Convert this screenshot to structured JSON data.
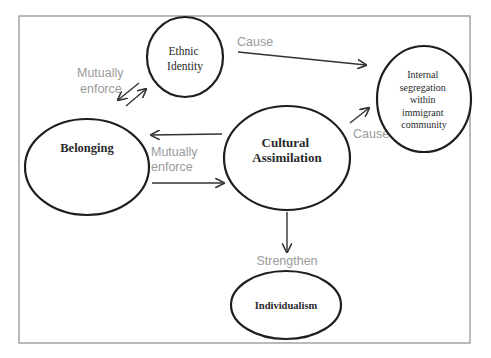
{
  "diagram": {
    "type": "concept-map",
    "nodes": {
      "ethnic_identity": {
        "lines": [
          "Ethnic",
          "Identity"
        ]
      },
      "internal_segregation": {
        "lines": [
          "Internal",
          "segregation",
          "within",
          "immigrant",
          "community"
        ]
      },
      "belonging": {
        "lines": [
          "Belonging"
        ]
      },
      "cultural_assimilation": {
        "lines": [
          "Cultural",
          "Assimilation"
        ]
      },
      "individualism": {
        "lines": [
          "Individualism"
        ]
      }
    },
    "edges": {
      "ethnic_to_segregation": {
        "from": "Ethnic Identity",
        "to": "Internal segregation within immigrant community",
        "label": "Cause"
      },
      "assimilation_to_segregation": {
        "from": "Cultural Assimilation",
        "to": "Internal segregation within immigrant community",
        "label": "Cause"
      },
      "belonging_ethnic": {
        "from": "Belonging",
        "to": "Ethnic Identity",
        "label_lines": [
          "Mutually",
          "enforce"
        ],
        "bidirectional": true
      },
      "belonging_assimilation": {
        "from": "Belonging",
        "to": "Cultural Assimilation",
        "label_lines": [
          "Mutually",
          "enforce"
        ],
        "bidirectional": true
      },
      "assimilation_to_individualism": {
        "from": "Cultural Assimilation",
        "to": "Individualism",
        "label": "Strengthen"
      }
    },
    "colors": {
      "node_stroke": "#1e1e1e",
      "edge_stroke": "#333333",
      "edge_label": "#9a9a9a",
      "frame": "#8c8c8c",
      "background": "#ffffff"
    }
  }
}
